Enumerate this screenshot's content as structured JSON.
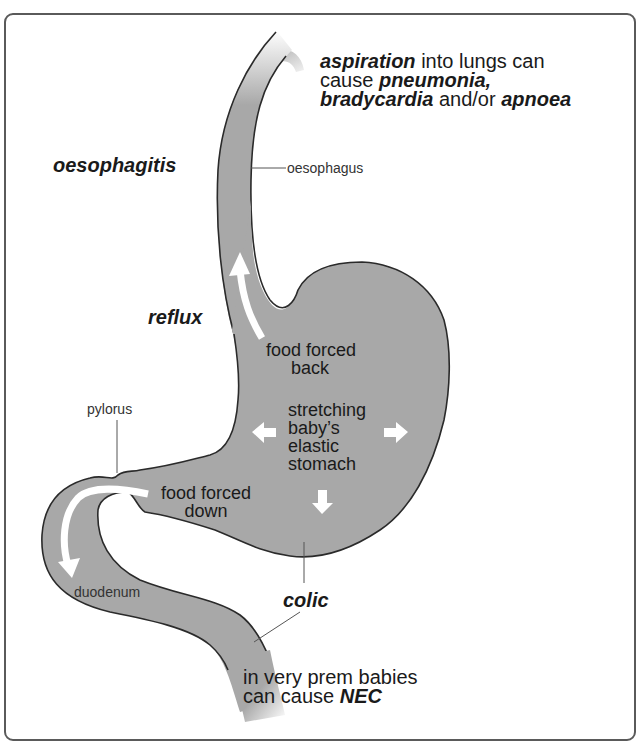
{
  "diagram": {
    "type": "anatomical-illustration",
    "colors": {
      "organ_fill": "#a8a8a8",
      "organ_outline": "#2a2a2a",
      "arrow": "#ffffff",
      "text": "#1a1a1a",
      "frame": "#5a5a5a"
    }
  },
  "labels": {
    "aspiration": {
      "line1_bold": "aspiration",
      "line1_rest": " into lungs can",
      "line2_plain": "cause ",
      "line2_bold": "pneumonia,",
      "line3_bold1": "bradycardia",
      "line3_plain": " and/or ",
      "line3_bold2": "apnoea"
    },
    "oesophagitis": "oesophagitis",
    "oesophagus": "oesophagus",
    "reflux": "reflux",
    "food_forced_back": [
      "food forced",
      "back"
    ],
    "pylorus": "pylorus",
    "stretching": [
      "stretching",
      "baby’s",
      "elastic",
      "stomach"
    ],
    "food_forced_down": [
      "food forced",
      "down"
    ],
    "duodenum": "duodenum",
    "colic": "colic",
    "nec": {
      "line1": "in very prem babies",
      "line2_plain": "can cause ",
      "line2_bold": "NEC"
    }
  }
}
